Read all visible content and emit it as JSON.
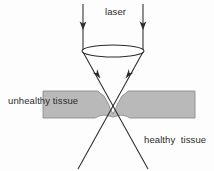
{
  "figure": {
    "width": 214,
    "height": 171,
    "background_color": "#fdfdfd",
    "stroke_color": "#2b2b2b",
    "tissue_fill_color": "#b9b9b9",
    "tissue_edge_color": "#8d8d8d"
  },
  "labels": {
    "laser": "laser",
    "unhealthy_tissue": "unhealthy tissue",
    "healthy_tissue": "healthy  tissue"
  },
  "elements": {
    "incoming_beam_left": "incoming-laser-ray-left",
    "incoming_beam_right": "incoming-laser-ray-right",
    "lens": "focusing-lens",
    "converging_beam_left": "converging-ray-left",
    "converging_beam_right": "converging-ray-right",
    "tissue_band": "unhealthy-tissue-layer",
    "focal_point": "beam-focal-point"
  },
  "geometry": {
    "lens_center_x": 113,
    "lens_center_y": 51,
    "lens_rx": 31,
    "lens_ry": 6,
    "focal_point_x": 113,
    "focal_point_y": 113,
    "tissue_top_y": 91,
    "tissue_bottom_y": 118,
    "tissue_left_x": 43,
    "tissue_right_x": 195
  }
}
